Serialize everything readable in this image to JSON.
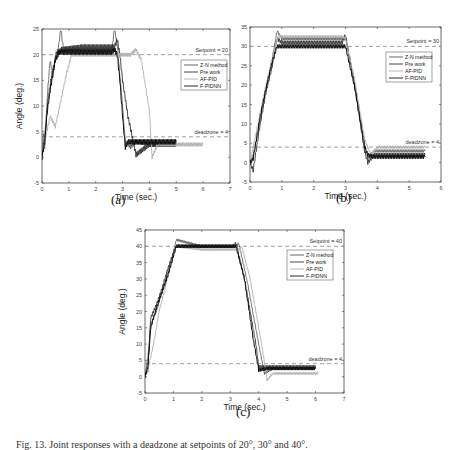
{
  "caption": "Fig. 13. Joint responses with a deadzone at setpoints of 20°, 30° and 40°.",
  "panels": [
    {
      "id": "a",
      "label": "(a)"
    },
    {
      "id": "b",
      "label": "(b)"
    },
    {
      "id": "c",
      "label": "(c)"
    }
  ],
  "colors": {
    "zn": "#555555",
    "pre": "#333333",
    "af": "#b0b0b0",
    "fpidnn": "#111111",
    "ref": "#888888",
    "axis": "#444444"
  },
  "chart_data": [
    {
      "type": "line",
      "panel": "(a)",
      "xlabel": "Time (sec.)",
      "ylabel": "Angle (deg.)",
      "xlim": [
        0,
        7
      ],
      "ylim": [
        -5,
        25
      ],
      "xticks": [
        0,
        1,
        2,
        3,
        4,
        5,
        6,
        7
      ],
      "yticks": [
        -5,
        0,
        5,
        10,
        15,
        20,
        25
      ],
      "grid": false,
      "legend": {
        "position": "upper right",
        "entries": [
          "Z-N method",
          "Pre work",
          "AF-PID",
          "F-PIDNN"
        ]
      },
      "annotations": [
        {
          "text": "Setpoint = 20",
          "y": 20,
          "style": "dashed"
        },
        {
          "text": "deadzone = 4",
          "y": 4,
          "style": "dashed"
        }
      ],
      "series": [
        {
          "name": "Z-N method",
          "key": "zn",
          "x": [
            0,
            0.05,
            0.1,
            0.2,
            0.3,
            0.4,
            0.5,
            0.6,
            0.7,
            0.8,
            1.5,
            2.6,
            2.7,
            2.8,
            3.0,
            3.1,
            3.3,
            3.5,
            4.0,
            5.0
          ],
          "y": [
            0,
            5,
            2,
            12,
            19,
            16,
            20,
            21,
            25,
            21,
            21,
            21,
            25,
            22,
            10,
            3,
            2,
            3,
            2.5,
            2.5
          ]
        },
        {
          "name": "Pre work",
          "key": "pre",
          "x": [
            0,
            0.1,
            0.2,
            0.3,
            0.4,
            0.5,
            0.6,
            0.7,
            1.5,
            2.7,
            2.8,
            2.9,
            3.0,
            3.2,
            3.4,
            3.5,
            4.0,
            5.0
          ],
          "y": [
            0,
            4,
            10,
            14,
            17,
            19,
            20,
            21,
            21.5,
            21.5,
            23,
            20,
            15,
            8,
            3,
            0.5,
            2.5,
            2.5
          ]
        },
        {
          "name": "AF-PID",
          "key": "af",
          "x": [
            0,
            0.1,
            0.3,
            0.5,
            0.7,
            0.9,
            1.1,
            2.0,
            3.0,
            3.3,
            3.5,
            3.7,
            4.0,
            4.1,
            4.3,
            5.0,
            6.0
          ],
          "y": [
            0,
            3,
            8,
            6,
            11,
            16,
            20,
            20,
            20,
            20,
            21,
            19,
            9,
            0,
            2.5,
            2.5,
            2.5
          ]
        },
        {
          "name": "F-PIDNN",
          "key": "fpidnn",
          "x": [
            0,
            0.1,
            0.2,
            0.3,
            0.4,
            0.5,
            0.6,
            1.5,
            2.6,
            2.7,
            2.8,
            2.9,
            3.0,
            3.1,
            3.2,
            3.5,
            4.0,
            5.0
          ],
          "y": [
            0,
            3,
            9,
            13,
            16,
            19,
            20.5,
            20.5,
            20.5,
            21,
            20,
            15,
            8,
            2,
            3,
            3,
            3,
            3
          ]
        }
      ]
    },
    {
      "type": "line",
      "panel": "(b)",
      "xlabel": "Time (sec.)",
      "ylabel": "",
      "xlim": [
        0,
        6
      ],
      "ylim": [
        -5,
        35
      ],
      "xticks": [
        0,
        1,
        2,
        3,
        4,
        5,
        6
      ],
      "yticks": [
        -5,
        0,
        5,
        10,
        15,
        20,
        25,
        30,
        35
      ],
      "grid": false,
      "legend": {
        "position": "upper right",
        "entries": [
          "Z-N method",
          "Pre work",
          "AF-PID",
          "F-PIDNN"
        ]
      },
      "annotations": [
        {
          "text": "Setpoint = 30",
          "y": 30,
          "style": "dashed"
        },
        {
          "text": "deadzone = 4",
          "y": 4,
          "style": "dashed"
        }
      ],
      "series": [
        {
          "name": "Z-N method",
          "key": "zn",
          "x": [
            0,
            0.1,
            0.3,
            0.5,
            0.7,
            0.85,
            1.0,
            2.0,
            2.9,
            3.0,
            3.3,
            3.6,
            3.7,
            3.9,
            4.5,
            5.5
          ],
          "y": [
            0,
            2,
            10,
            19,
            27,
            34,
            32,
            32,
            32,
            32,
            20,
            5,
            1,
            3,
            3,
            3
          ]
        },
        {
          "name": "Pre work",
          "key": "pre",
          "x": [
            0,
            0.1,
            0.3,
            0.5,
            0.7,
            0.85,
            1.0,
            2.0,
            2.9,
            3.0,
            3.3,
            3.6,
            3.7,
            3.9,
            4.5,
            5.5
          ],
          "y": [
            0,
            -2,
            9,
            18,
            25,
            32,
            31,
            31,
            31,
            33,
            19,
            3,
            0,
            2,
            2,
            2
          ]
        },
        {
          "name": "AF-PID",
          "key": "af",
          "x": [
            0,
            0.1,
            0.3,
            0.5,
            0.7,
            0.9,
            1.0,
            2.0,
            2.9,
            3.0,
            3.3,
            3.6,
            3.8,
            4.0,
            4.5,
            5.5
          ],
          "y": [
            0,
            4,
            12,
            20,
            27,
            33,
            32.5,
            32.5,
            32.5,
            32,
            21,
            6,
            2,
            4,
            4,
            4
          ]
        },
        {
          "name": "F-PIDNN",
          "key": "fpidnn",
          "x": [
            0,
            0.1,
            0.3,
            0.5,
            0.7,
            0.85,
            1.0,
            2.0,
            2.9,
            3.0,
            3.3,
            3.6,
            3.7,
            3.9,
            4.5,
            5.5
          ],
          "y": [
            0,
            1,
            11,
            19,
            26,
            30,
            30,
            30,
            30,
            30,
            19,
            4,
            2,
            1.5,
            1.5,
            1.5
          ]
        }
      ]
    },
    {
      "type": "line",
      "panel": "(c)",
      "xlabel": "Time (sec.)",
      "ylabel": "Angle (deg.)",
      "xlim": [
        0,
        7
      ],
      "ylim": [
        -5,
        45
      ],
      "xticks": [
        0,
        1,
        2,
        3,
        4,
        5,
        6,
        7
      ],
      "yticks": [
        -5,
        0,
        5,
        10,
        15,
        20,
        25,
        30,
        35,
        40,
        45
      ],
      "grid": false,
      "legend": {
        "position": "upper right",
        "entries": [
          "Z-N method",
          "Pre work",
          "AF-PID",
          "F-PIDNN"
        ]
      },
      "annotations": [
        {
          "text": "Setpoint = 40",
          "y": 40,
          "style": "dashed"
        },
        {
          "text": "deadzone = 4",
          "y": 4,
          "style": "dashed"
        }
      ],
      "series": [
        {
          "name": "Z-N method",
          "key": "zn",
          "x": [
            0,
            0.1,
            0.2,
            0.4,
            0.6,
            0.8,
            1.0,
            1.1,
            2.0,
            3.2,
            3.3,
            3.6,
            4.0,
            4.2,
            4.5,
            5.5,
            6.0
          ],
          "y": [
            0,
            6,
            16,
            20,
            26,
            32,
            38,
            42,
            40,
            40,
            41,
            29,
            10,
            1,
            2.5,
            2.5,
            2.5
          ]
        },
        {
          "name": "Pre work",
          "key": "pre",
          "x": [
            0,
            0.1,
            0.2,
            0.4,
            0.6,
            0.8,
            1.0,
            1.1,
            2.0,
            3.1,
            3.2,
            3.5,
            3.9,
            4.0,
            4.3,
            5.5,
            6.0
          ],
          "y": [
            0,
            2,
            18,
            22,
            27,
            33,
            38,
            40,
            40,
            40,
            41,
            30,
            10,
            3,
            3,
            3,
            3
          ]
        },
        {
          "name": "AF-PID",
          "key": "af",
          "x": [
            0,
            0.1,
            0.3,
            0.5,
            0.7,
            0.9,
            1.1,
            2.0,
            3.3,
            3.4,
            3.7,
            4.1,
            4.3,
            4.5,
            5.5,
            6.1
          ],
          "y": [
            0,
            2,
            10,
            20,
            27,
            34,
            40,
            39,
            39,
            40,
            30,
            10,
            -1,
            1,
            1,
            1
          ]
        },
        {
          "name": "F-PIDNN",
          "key": "fpidnn",
          "x": [
            0,
            0.1,
            0.2,
            0.4,
            0.6,
            0.8,
            1.0,
            1.1,
            2.0,
            3.0,
            3.2,
            3.5,
            3.8,
            4.0,
            4.3,
            5.5,
            6.0
          ],
          "y": [
            0,
            3,
            15,
            21,
            26,
            31,
            37,
            40,
            40,
            40,
            40,
            30,
            12,
            2,
            2.5,
            2.5,
            2.5
          ]
        }
      ]
    }
  ],
  "layout": [
    {
      "left": 42,
      "right": 230,
      "top": 29,
      "bottom": 183,
      "label_x": 120,
      "label_y": 203,
      "show_ylabel": true,
      "ylabel_x": 14,
      "legend_x": 181,
      "legend_y": 60
    },
    {
      "left": 250,
      "right": 441,
      "top": 27,
      "bottom": 182,
      "label_x": 335,
      "label_y": 201,
      "show_ylabel": false,
      "ylabel_x": 0,
      "legend_x": 386,
      "legend_y": 52
    },
    {
      "left": 145,
      "right": 344,
      "top": 230,
      "bottom": 393,
      "label_x": 232,
      "label_y": 414,
      "show_ylabel": true,
      "ylabel_x": 117,
      "legend_x": 287,
      "legend_y": 250
    }
  ]
}
